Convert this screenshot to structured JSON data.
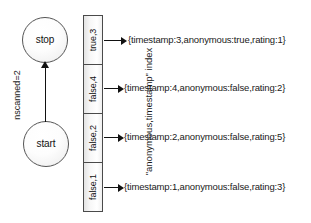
{
  "diagram": {
    "state_machine": {
      "nodes": [
        {
          "id": "stop",
          "label": "stop"
        },
        {
          "id": "start",
          "label": "start"
        }
      ],
      "transition_label": "nscanned=2"
    },
    "index": {
      "caption": "\"anonymous,timestamp\" index",
      "cells": [
        {
          "key": "true,3"
        },
        {
          "key": "false,4"
        },
        {
          "key": "false,2"
        },
        {
          "key": "false,1"
        }
      ]
    },
    "documents": [
      {
        "text": "{timestamp:3,anonymous:true,rating:1}"
      },
      {
        "text": "{timestamp:4,anonymous:false,rating:2}"
      },
      {
        "text": "{timestamp:2,anonymous:false,rating:5}"
      },
      {
        "text": "{timestamp:1,anonymous:false,rating:3}"
      }
    ],
    "colors": {
      "stroke": "#111111",
      "cell_border": "#4a4a4a",
      "node_border": "#555555",
      "background": "#ffffff",
      "text": "#1a1a1a"
    }
  }
}
